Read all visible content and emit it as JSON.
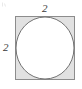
{
  "figure": {
    "name": "square-with-inscribed-circle",
    "canvas": {
      "width": 82,
      "height": 89,
      "background": "#ffffff"
    },
    "square": {
      "name": "outer-square",
      "x": 15,
      "y": 16,
      "width": 60,
      "height": 64,
      "fill": "#e1e1e1",
      "stroke": "#8c8c8c",
      "stroke_width": 1
    },
    "circle": {
      "name": "inscribed-circle",
      "cx": 45,
      "cy": 48,
      "rx": 29.5,
      "ry": 31.5,
      "fill": "#ffffff",
      "stroke": "#737373",
      "stroke_width": 1
    },
    "labels": {
      "top": {
        "name": "top-side-length",
        "text": "2",
        "color": "#3a3a3a"
      },
      "left": {
        "name": "left-side-length",
        "text": "2",
        "color": "#3a3a3a"
      }
    },
    "corner_mark": {
      "name": "corner-speck",
      "color": "#b9b9b9"
    }
  }
}
